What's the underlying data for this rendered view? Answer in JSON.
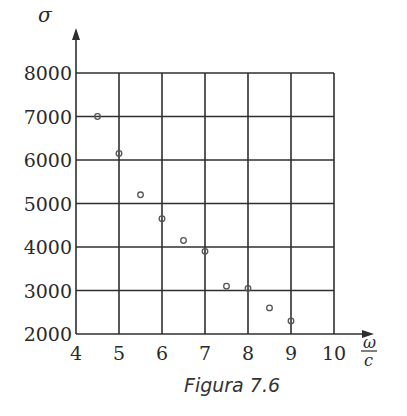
{
  "chart_data": {
    "type": "scatter",
    "title": "",
    "caption": "Figura 7.6",
    "xlabel": {
      "numerator": "ω",
      "denominator": "c"
    },
    "ylabel": "σ",
    "xlim": [
      4,
      10
    ],
    "ylim": [
      2000,
      8000
    ],
    "grid": true,
    "x_ticks": [
      "4",
      "5",
      "6",
      "7",
      "8",
      "9",
      "10"
    ],
    "y_ticks": [
      "2000",
      "3000",
      "4000",
      "5000",
      "6000",
      "7000",
      "8000"
    ],
    "x_tick_values": [
      4,
      5,
      6,
      7,
      8,
      9,
      10
    ],
    "y_tick_values": [
      2000,
      3000,
      4000,
      5000,
      6000,
      7000,
      8000
    ],
    "marker": "open-circle",
    "points": [
      {
        "x": 4.5,
        "y": 7000
      },
      {
        "x": 5.0,
        "y": 6150
      },
      {
        "x": 5.5,
        "y": 5200
      },
      {
        "x": 6.0,
        "y": 4650
      },
      {
        "x": 6.5,
        "y": 4150
      },
      {
        "x": 7.0,
        "y": 3900
      },
      {
        "x": 7.5,
        "y": 3100
      },
      {
        "x": 8.0,
        "y": 3050
      },
      {
        "x": 8.5,
        "y": 2600
      },
      {
        "x": 9.0,
        "y": 2300
      }
    ]
  }
}
